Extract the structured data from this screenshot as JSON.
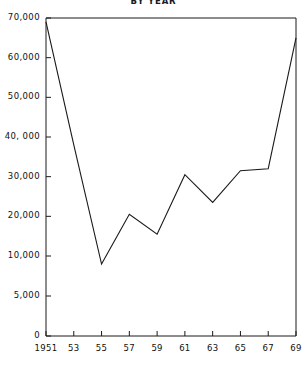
{
  "chart_data": {
    "type": "line",
    "title": "BY YEAR",
    "xlabel": "",
    "ylabel": "",
    "grid": false,
    "legend": null,
    "x": [
      1951,
      1953,
      1955,
      1957,
      1959,
      1961,
      1963,
      1965,
      1967,
      1969
    ],
    "categories": [
      "1951",
      "53",
      "55",
      "57",
      "59",
      "61",
      "63",
      "65",
      "67",
      "69"
    ],
    "values": [
      69000,
      38000,
      9000,
      20500,
      15500,
      30500,
      23500,
      31500,
      32000,
      65000
    ],
    "series": [
      {
        "name": "series-1",
        "values": [
          69000,
          38000,
          9000,
          20500,
          15500,
          30500,
          23500,
          31500,
          32000,
          65000
        ]
      }
    ],
    "ylim": [
      0,
      70000
    ],
    "xlim": [
      1951,
      1969
    ],
    "yticks": [
      0,
      5000,
      10000,
      20000,
      30000,
      40000,
      50000,
      60000,
      70000
    ],
    "ytick_labels": [
      "0",
      "5,000",
      "10,000",
      "20,000",
      "30,000",
      "40, 000",
      "50,000",
      "60,000",
      "70,000"
    ],
    "xtick_labels": [
      "1951",
      "53",
      "55",
      "57",
      "59",
      "61",
      "63",
      "65",
      "67",
      "69"
    ],
    "note": "y-axis uses non-uniform spacing: 0 to 10,000 compressed, 10,000 to 70,000 evenly spaced",
    "line_color": "#1a1a1a",
    "axis_color": "#1a1a1a",
    "background": "#ffffff"
  }
}
